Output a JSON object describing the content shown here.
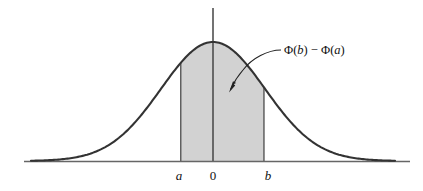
{
  "figure": {
    "background_color": "#ffffff",
    "curve_color": "#333333",
    "axis_color": "#555555",
    "shade_color": "#d2d2d2",
    "shade_edge_color": "#555555",
    "text_color": "#111111"
  },
  "annotation": {
    "label_full": "Φ(b) − Φ(a)",
    "phi_1": "Φ(",
    "var_b": "b",
    "close_1": ")",
    "minus": " − ",
    "phi_2": "Φ(",
    "var_a": "a",
    "close_2": ")",
    "pointer_name": "curved-arrow-to-shaded-region"
  },
  "axis": {
    "ticks": [
      {
        "label": "a",
        "italic": true,
        "x": 179
      },
      {
        "label": "0",
        "italic": false,
        "x": 213
      },
      {
        "label": "b",
        "italic": true,
        "x": 268
      }
    ],
    "x_axis_y": 161,
    "y_axis_x": 213
  },
  "chart_data": {
    "type": "area",
    "title": "",
    "subtitle": "",
    "xlabel": "",
    "ylabel": "",
    "grid": false,
    "legend_position": "none",
    "distribution": "standard normal (Gaussian) probability density",
    "mean": 0,
    "sd": 1,
    "xlim": [
      -3.5,
      3.5
    ],
    "ylim": [
      0,
      0.45
    ],
    "shaded_interval": {
      "from_label": "a",
      "to_label": "b",
      "from": -0.62,
      "to": 0.98
    },
    "shaded_area_expression": "Φ(b) − Φ(a)",
    "tick_labels": [
      "a",
      "0",
      "b"
    ],
    "x": [
      -3.5,
      -3.25,
      -3.0,
      -2.75,
      -2.5,
      -2.25,
      -2.0,
      -1.75,
      -1.5,
      -1.25,
      -1.0,
      -0.75,
      -0.5,
      -0.25,
      0.0,
      0.25,
      0.5,
      0.75,
      1.0,
      1.25,
      1.5,
      1.75,
      2.0,
      2.25,
      2.5,
      2.75,
      3.0,
      3.25,
      3.5
    ],
    "y": [
      0.0009,
      0.002,
      0.0044,
      0.0091,
      0.0175,
      0.0317,
      0.054,
      0.0863,
      0.1295,
      0.1826,
      0.242,
      0.3011,
      0.3521,
      0.3867,
      0.3989,
      0.3867,
      0.3521,
      0.3011,
      0.242,
      0.1826,
      0.1295,
      0.0863,
      0.054,
      0.0317,
      0.0175,
      0.0091,
      0.0044,
      0.002,
      0.0009
    ]
  }
}
